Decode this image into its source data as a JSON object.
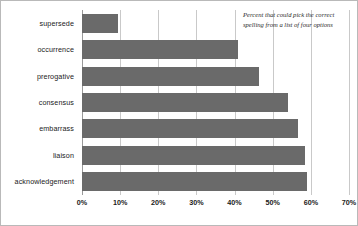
{
  "chart_data": {
    "type": "bar",
    "orientation": "horizontal",
    "title": "",
    "xlabel": "",
    "ylabel": "",
    "categories": [
      "supersede",
      "occurrence",
      "prerogative",
      "consensus",
      "embarrass",
      "liaison",
      "acknowledgement"
    ],
    "values": [
      9.5,
      41,
      46.5,
      54,
      56.5,
      58.5,
      59
    ],
    "xlim": [
      0,
      70
    ],
    "xticks": [
      0,
      10,
      20,
      30,
      40,
      50,
      60,
      70
    ],
    "xtick_labels": [
      "0%",
      "10%",
      "20%",
      "30%",
      "40%",
      "50%",
      "60%",
      "70%"
    ],
    "grid": true,
    "grid_axis": "x",
    "legend": false,
    "annotations": [
      {
        "position": "top-right",
        "lines": [
          "Percent that could pick the correct",
          "spelling from a list of four options"
        ],
        "style": "italic-serif"
      }
    ],
    "colors": {
      "bar_fill": "#6a6a6a",
      "gridline": "#c9c9c9",
      "axis": "#9a9a9a",
      "background": "#ffffff",
      "border": "#b9b9b9",
      "text": "#1a1a1a"
    }
  }
}
